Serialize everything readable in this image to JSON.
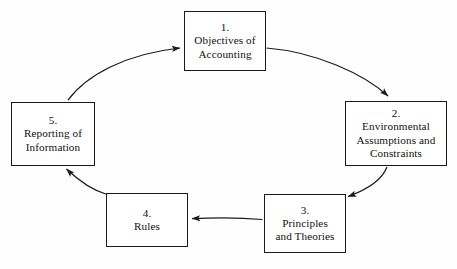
{
  "diagram": {
    "type": "cycle-flow",
    "background_color": "#ffffff",
    "line_color": "#1a1a1a",
    "text_color": "#111111",
    "nodes": [
      {
        "id": "node-1",
        "number": "1.",
        "lines": [
          "Objectives of",
          "Accounting"
        ],
        "label": "1. Objectives of Accounting"
      },
      {
        "id": "node-2",
        "number": "2.",
        "lines": [
          "Environmental",
          "Assumptions and",
          "Constraints"
        ],
        "label": "2. Environmental Assumptions and Constraints"
      },
      {
        "id": "node-3",
        "number": "3.",
        "lines": [
          "Principles",
          "and Theories"
        ],
        "label": "3. Principles and Theories"
      },
      {
        "id": "node-4",
        "number": "4.",
        "lines": [
          "Rules"
        ],
        "label": "4. Rules"
      },
      {
        "id": "node-5",
        "number": "5.",
        "lines": [
          "Reporting of",
          "Information"
        ],
        "label": "5. Reporting of Information"
      }
    ],
    "arrows": [
      {
        "from": "node-1",
        "to": "node-2",
        "style": "curved"
      },
      {
        "from": "node-2",
        "to": "node-3",
        "style": "curved"
      },
      {
        "from": "node-3",
        "to": "node-4",
        "style": "straight"
      },
      {
        "from": "node-4",
        "to": "node-5",
        "style": "curved"
      },
      {
        "from": "node-5",
        "to": "node-1",
        "style": "curved"
      }
    ]
  }
}
